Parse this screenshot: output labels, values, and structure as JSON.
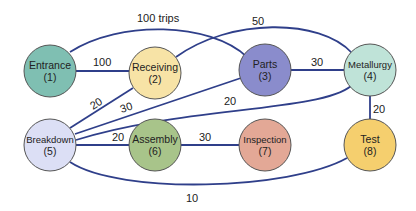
{
  "diagram": {
    "type": "flow-graph",
    "nodes": [
      {
        "id": 1,
        "name": "Entrance",
        "num": "(1)",
        "color": "#7fbfb2"
      },
      {
        "id": 2,
        "name": "Receiving",
        "num": "(2)",
        "color": "#f7e3a6"
      },
      {
        "id": 3,
        "name": "Parts",
        "num": "(3)",
        "color": "#8a8ccc"
      },
      {
        "id": 4,
        "name": "Metallurgy",
        "num": "(4)",
        "color": "#bfe3d8"
      },
      {
        "id": 5,
        "name": "Breakdown",
        "num": "(5)",
        "color": "#dcdff5"
      },
      {
        "id": 6,
        "name": "Assembly",
        "num": "(6)",
        "color": "#a8c48a"
      },
      {
        "id": 7,
        "name": "Inspection",
        "num": "(7)",
        "color": "#e3a896"
      },
      {
        "id": 8,
        "name": "Test",
        "num": "(8)",
        "color": "#f5cf6e"
      }
    ],
    "edges": [
      {
        "from": 1,
        "to": 3,
        "label": "100 trips"
      },
      {
        "from": 1,
        "to": 2,
        "label": "100"
      },
      {
        "from": 2,
        "to": 4,
        "label": "50"
      },
      {
        "from": 3,
        "to": 4,
        "label": "30"
      },
      {
        "from": 5,
        "to": 2,
        "label": "20"
      },
      {
        "from": 5,
        "to": 3,
        "label": "30"
      },
      {
        "from": 5,
        "to": 4,
        "label": "20"
      },
      {
        "from": 5,
        "to": 6,
        "label": "20"
      },
      {
        "from": 6,
        "to": 7,
        "label": "30"
      },
      {
        "from": 4,
        "to": 8,
        "label": "20"
      },
      {
        "from": 5,
        "to": 8,
        "label": "10"
      }
    ],
    "edge_color": "#2f3f8a"
  }
}
